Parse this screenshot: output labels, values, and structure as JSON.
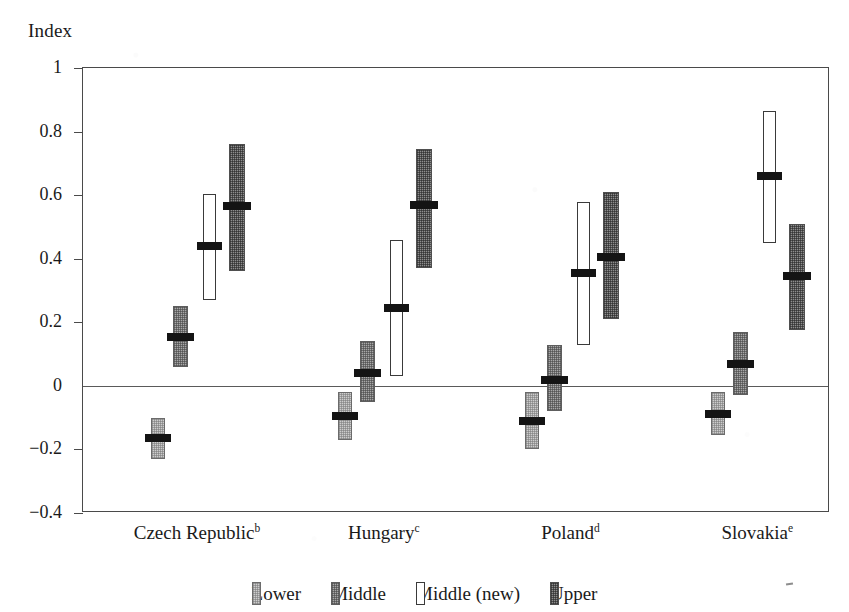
{
  "chart_data": {
    "type": "bar",
    "title": "",
    "ylabel": "Index",
    "xlabel": "",
    "ylim": [
      -0.4,
      1
    ],
    "yticks": [
      1,
      0.8,
      0.6,
      0.4,
      0.2,
      0,
      -0.2,
      -0.4
    ],
    "ytick_labels": [
      "1",
      "0.8",
      "0.6",
      "0.4",
      "0.2",
      "0",
      "−0.2",
      "−0.4"
    ],
    "grid": false,
    "zero_line": true,
    "legend_position": "bottom",
    "categories": [
      "Czech Republic",
      "Hungary",
      "Poland",
      "Slovakia"
    ],
    "category_superscripts": [
      "b",
      "c",
      "d",
      "e"
    ],
    "series": [
      {
        "name": "Lower",
        "key": "lower",
        "color": "#cdcdcd",
        "values": [
          -0.165,
          -0.095,
          -0.11,
          -0.09
        ],
        "low": [
          -0.23,
          -0.17,
          -0.2,
          -0.155
        ],
        "high": [
          -0.1,
          -0.02,
          -0.02,
          -0.02
        ]
      },
      {
        "name": "Middle",
        "key": "middle",
        "color": "#a8a8a8",
        "values": [
          0.155,
          0.04,
          0.02,
          0.07
        ],
        "low": [
          0.06,
          -0.05,
          -0.08,
          -0.03
        ],
        "high": [
          0.25,
          0.14,
          0.13,
          0.17
        ]
      },
      {
        "name": "Middle (new)",
        "key": "middlenew",
        "color": "#ffffff",
        "values": [
          0.44,
          0.245,
          0.355,
          0.66
        ],
        "low": [
          0.27,
          0.03,
          0.13,
          0.45
        ],
        "high": [
          0.605,
          0.46,
          0.58,
          0.865
        ]
      },
      {
        "name": "Upper",
        "key": "upper",
        "color": "#8e8e8e",
        "values": [
          0.565,
          0.57,
          0.405,
          0.345
        ],
        "low": [
          0.36,
          0.37,
          0.21,
          0.175
        ],
        "high": [
          0.76,
          0.745,
          0.61,
          0.51
        ]
      }
    ]
  },
  "legend": {
    "items": [
      {
        "label": "Lower",
        "key": "lower"
      },
      {
        "label": "Middle",
        "key": "middle"
      },
      {
        "label": "Middle (new)",
        "key": "middlenew"
      },
      {
        "label": "Upper",
        "key": "upper"
      }
    ]
  }
}
